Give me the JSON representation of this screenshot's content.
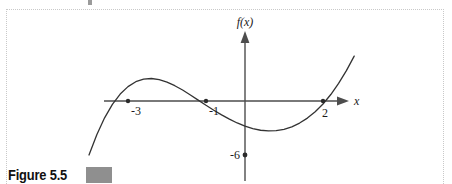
{
  "figure": {
    "caption": "Figure 5.5",
    "caption_box_color": "#8f8f8f",
    "border_color": "#c9c9c9",
    "background": "#ffffff"
  },
  "chart_data": {
    "type": "line",
    "title": "",
    "xlabel": "x",
    "ylabel": "f(x)",
    "curve_color": "#333333",
    "axis_color": "#4d4d4d",
    "grid": false,
    "legend": null,
    "xlim": [
      -4.2,
      2.9
    ],
    "ylim": [
      -9.5,
      6.5
    ],
    "x_tick_labels": [
      "-3",
      "-1",
      "2"
    ],
    "x_ticks": [
      -3,
      -1,
      2
    ],
    "y_tick_labels": [
      "-6"
    ],
    "y_ticks": [
      -6
    ],
    "annotations": [
      {
        "label": "f(x)",
        "kind": "axis-label",
        "position": "y-axis-top"
      },
      {
        "label": "x",
        "kind": "axis-label",
        "position": "x-axis-right"
      }
    ],
    "marked_points": [
      {
        "x": -3,
        "y": 0,
        "label": "-3"
      },
      {
        "x": -1,
        "y": 0,
        "label": "-1"
      },
      {
        "x": 2,
        "y": 0,
        "label": "2"
      },
      {
        "x": 0,
        "y": -6,
        "label": "-6"
      }
    ],
    "features": {
      "roots": [
        -3,
        -1,
        2
      ],
      "y_intercept": -6,
      "local_maximum": {
        "x": -1.98,
        "y": 5.9
      },
      "local_minimum": {
        "x": 0.98,
        "y": -8.0
      }
    },
    "series": [
      {
        "name": "f(x)",
        "expression": "f(x) = (x + 3)(x + 1)(x - 2)",
        "x": [
          -4.0,
          -3.8,
          -3.6,
          -3.4,
          -3.2,
          -3.0,
          -2.8,
          -2.6,
          -2.4,
          -2.2,
          -2.0,
          -1.8,
          -1.6,
          -1.4,
          -1.2,
          -1.0,
          -0.8,
          -0.6,
          -0.4,
          -0.2,
          0.0,
          0.2,
          0.4,
          0.6,
          0.8,
          1.0,
          1.2,
          1.4,
          1.6,
          1.8,
          2.0,
          2.2,
          2.4,
          2.6,
          2.8
        ],
        "y": [
          -6.0,
          -3.74,
          -1.87,
          -0.38,
          0.77,
          1.6,
          2.14,
          2.43,
          2.5,
          2.38,
          2.1,
          1.7,
          1.22,
          0.67,
          0.1,
          -0.48,
          -1.02,
          -1.54,
          -2.02,
          -2.44,
          -2.8,
          -3.07,
          -3.25,
          -3.33,
          -3.3,
          -3.15,
          -2.87,
          -2.45,
          -1.9,
          -1.19,
          -0.33,
          0.72,
          1.95,
          3.37,
          4.99
        ]
      }
    ]
  }
}
